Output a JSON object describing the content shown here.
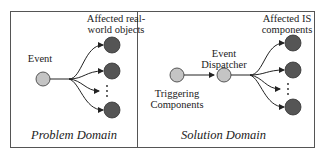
{
  "problem_domain": {
    "title": "Problem Domain",
    "event_label": "Event",
    "targets_label_line1": "Affected real-",
    "targets_label_line2": "world objects",
    "ellipsis": "⋮"
  },
  "solution_domain": {
    "title": "Solution Domain",
    "source_label_line1": "Triggering",
    "source_label_line2": "Components",
    "dispatcher_label_line1": "Event",
    "dispatcher_label_line2": "Dispatcher",
    "targets_label_line1": "Affected IS",
    "targets_label_line2": "components",
    "ellipsis": "⋮"
  },
  "colors": {
    "light_node": "#c4c4c4",
    "dark_node": "#555555",
    "stroke": "#222222",
    "frame": "#555555"
  }
}
